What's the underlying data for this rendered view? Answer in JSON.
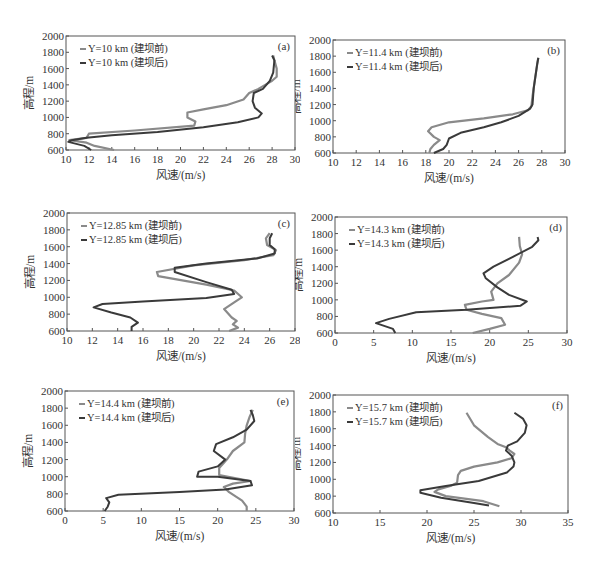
{
  "figure": {
    "ylabel": "高程/m",
    "xlabel": "风速/(m/s)",
    "legend_suffix_before": "(建坝前)",
    "legend_suffix_after": "(建坝后)",
    "colors": {
      "before": "#8a8a8a",
      "after": "#3a3a3a",
      "frame": "#555555"
    }
  },
  "chart_data": [
    {
      "type": "line",
      "panel": "(a)",
      "title": "",
      "xlabel": "风速/(m/s)",
      "ylabel": "高程/m",
      "xlim": [
        10,
        30
      ],
      "ylim": [
        600,
        2000
      ],
      "xticks": [
        10,
        12,
        14,
        16,
        18,
        20,
        22,
        24,
        26,
        28,
        30
      ],
      "yticks": [
        600,
        800,
        1000,
        1200,
        1400,
        1600,
        1800,
        2000
      ],
      "legend_position": "upper left",
      "series": [
        {
          "name": "Y=10 km (建坝前)",
          "points": [
            [
              14.2,
              600
            ],
            [
              12.5,
              650
            ],
            [
              11.8,
              690
            ],
            [
              10.3,
              720
            ],
            [
              11.8,
              750
            ],
            [
              12,
              800
            ],
            [
              16,
              840
            ],
            [
              21.2,
              900
            ],
            [
              21.3,
              950
            ],
            [
              20.6,
              1000
            ],
            [
              20.6,
              1060
            ],
            [
              22,
              1100
            ],
            [
              24,
              1150
            ],
            [
              25.5,
              1220
            ],
            [
              26,
              1300
            ],
            [
              26.8,
              1350
            ],
            [
              27.4,
              1400
            ],
            [
              28,
              1450
            ],
            [
              28.4,
              1500
            ],
            [
              28.4,
              1600
            ],
            [
              28.2,
              1700
            ],
            [
              28.1,
              1760
            ]
          ]
        },
        {
          "name": "Y=10 km (建坝后)",
          "points": [
            [
              12.2,
              600
            ],
            [
              11.6,
              650
            ],
            [
              10.2,
              700
            ],
            [
              10.5,
              720
            ],
            [
              11.8,
              750
            ],
            [
              14,
              780
            ],
            [
              18,
              820
            ],
            [
              22,
              880
            ],
            [
              25,
              940
            ],
            [
              26.8,
              1000
            ],
            [
              27.1,
              1050
            ],
            [
              26.5,
              1120
            ],
            [
              26.3,
              1200
            ],
            [
              26.4,
              1300
            ],
            [
              27.2,
              1350
            ],
            [
              27.8,
              1450
            ],
            [
              28.1,
              1550
            ],
            [
              28.2,
              1700
            ],
            [
              28.0,
              1760
            ]
          ]
        }
      ]
    },
    {
      "type": "line",
      "panel": "(b)",
      "title": "",
      "xlabel": "风速/(m/s)",
      "ylabel": "高程/m",
      "xlim": [
        10,
        30
      ],
      "ylim": [
        600,
        2000
      ],
      "xticks": [
        10,
        12,
        14,
        16,
        18,
        20,
        22,
        24,
        26,
        28,
        30
      ],
      "yticks": [
        600,
        800,
        1000,
        1200,
        1400,
        1600,
        1800,
        2000
      ],
      "legend_position": "upper left",
      "series": [
        {
          "name": "Y=11.4 km (建坝前)",
          "points": [
            [
              18.3,
              600
            ],
            [
              18.4,
              650
            ],
            [
              18.7,
              700
            ],
            [
              19.2,
              760
            ],
            [
              18.7,
              800
            ],
            [
              18.2,
              870
            ],
            [
              18.5,
              920
            ],
            [
              20,
              980
            ],
            [
              23,
              1030
            ],
            [
              25.5,
              1080
            ],
            [
              26.8,
              1130
            ],
            [
              27.1,
              1180
            ],
            [
              27.2,
              1300
            ],
            [
              27.4,
              1500
            ],
            [
              27.6,
              1700
            ],
            [
              27.7,
              1780
            ]
          ]
        },
        {
          "name": "Y=11.4 km (建坝后)",
          "points": [
            [
              18.7,
              600
            ],
            [
              19.5,
              650
            ],
            [
              19.8,
              700
            ],
            [
              20,
              780
            ],
            [
              21,
              850
            ],
            [
              23,
              920
            ],
            [
              24.5,
              980
            ],
            [
              26,
              1060
            ],
            [
              27,
              1150
            ],
            [
              27.2,
              1200
            ],
            [
              27.3,
              1400
            ],
            [
              27.6,
              1700
            ],
            [
              27.7,
              1780
            ]
          ]
        }
      ]
    },
    {
      "type": "line",
      "panel": "(c)",
      "title": "",
      "xlabel": "风速/(m/s)",
      "ylabel": "高程/m",
      "xlim": [
        10,
        28
      ],
      "ylim": [
        600,
        2000
      ],
      "xticks": [
        10,
        12,
        14,
        16,
        18,
        20,
        22,
        24,
        26,
        28
      ],
      "yticks": [
        600,
        800,
        1000,
        1200,
        1400,
        1600,
        1800,
        2000
      ],
      "legend_position": "upper left",
      "series": [
        {
          "name": "Y=12.85 km (建坝前)",
          "points": [
            [
              22.8,
              600
            ],
            [
              23.5,
              640
            ],
            [
              23.1,
              680
            ],
            [
              23.4,
              720
            ],
            [
              23.0,
              760
            ],
            [
              22.4,
              860
            ],
            [
              23.2,
              940
            ],
            [
              23.8,
              1000
            ],
            [
              23.2,
              1080
            ],
            [
              21,
              1150
            ],
            [
              17.2,
              1250
            ],
            [
              17.1,
              1300
            ],
            [
              20,
              1380
            ],
            [
              24,
              1440
            ],
            [
              26.3,
              1500
            ],
            [
              26.5,
              1560
            ],
            [
              25.8,
              1620
            ],
            [
              25.7,
              1700
            ],
            [
              26,
              1760
            ]
          ]
        },
        {
          "name": "Y=12.85 km (建坝后)",
          "points": [
            [
              15.1,
              600
            ],
            [
              15.1,
              650
            ],
            [
              15.6,
              700
            ],
            [
              15,
              760
            ],
            [
              13.5,
              820
            ],
            [
              12.1,
              880
            ],
            [
              12.8,
              920
            ],
            [
              16,
              950
            ],
            [
              21,
              990
            ],
            [
              23.2,
              1040
            ],
            [
              23,
              1090
            ],
            [
              21,
              1180
            ],
            [
              18.5,
              1300
            ],
            [
              18.5,
              1350
            ],
            [
              21,
              1400
            ],
            [
              25,
              1460
            ],
            [
              26.4,
              1520
            ],
            [
              26.4,
              1570
            ],
            [
              26,
              1620
            ],
            [
              26,
              1700
            ],
            [
              26.2,
              1760
            ]
          ]
        }
      ]
    },
    {
      "type": "line",
      "panel": "(d)",
      "title": "",
      "xlabel": "风速/(m/s)",
      "ylabel": "高程/m",
      "xlim": [
        0,
        30
      ],
      "ylim": [
        600,
        2000
      ],
      "xticks": [
        0,
        5,
        10,
        15,
        20,
        25,
        30
      ],
      "yticks": [
        600,
        800,
        1000,
        1200,
        1400,
        1600,
        1800,
        2000
      ],
      "legend_position": "upper left",
      "series": [
        {
          "name": "Y=14.3 km (建坝前)",
          "points": [
            [
              17.8,
              600
            ],
            [
              20,
              650
            ],
            [
              22,
              700
            ],
            [
              21.5,
              780
            ],
            [
              19,
              830
            ],
            [
              17,
              880
            ],
            [
              16.8,
              940
            ],
            [
              19,
              980
            ],
            [
              20.5,
              1000
            ],
            [
              20.2,
              1100
            ],
            [
              21,
              1200
            ],
            [
              22.5,
              1300
            ],
            [
              23.8,
              1450
            ],
            [
              24.2,
              1550
            ],
            [
              23.9,
              1650
            ],
            [
              23.8,
              1760
            ]
          ]
        },
        {
          "name": "Y=14.3 km (建坝后)",
          "points": [
            [
              7.8,
              600
            ],
            [
              7.5,
              650
            ],
            [
              5.3,
              720
            ],
            [
              7,
              770
            ],
            [
              10.5,
              850
            ],
            [
              17,
              880
            ],
            [
              24,
              930
            ],
            [
              24.8,
              980
            ],
            [
              22.5,
              1060
            ],
            [
              21,
              1150
            ],
            [
              19.5,
              1260
            ],
            [
              19.2,
              1320
            ],
            [
              20.5,
              1400
            ],
            [
              23,
              1520
            ],
            [
              25.5,
              1640
            ],
            [
              26.3,
              1720
            ],
            [
              26.2,
              1760
            ]
          ]
        }
      ]
    },
    {
      "type": "line",
      "panel": "(e)",
      "title": "",
      "xlabel": "风速/(m/s)",
      "ylabel": "高程/m",
      "xlim": [
        0,
        30
      ],
      "ylim": [
        600,
        2000
      ],
      "xticks": [
        0,
        5,
        10,
        15,
        20,
        25,
        30
      ],
      "yticks": [
        600,
        800,
        1000,
        1200,
        1400,
        1600,
        1800,
        2000
      ],
      "legend_position": "upper left",
      "series": [
        {
          "name": "Y=14.4 km (建坝前)",
          "points": [
            [
              23.8,
              600
            ],
            [
              23.8,
              650
            ],
            [
              23.2,
              720
            ],
            [
              21.5,
              820
            ],
            [
              20.8,
              880
            ],
            [
              22,
              920
            ],
            [
              24.3,
              950
            ],
            [
              20.2,
              1020
            ],
            [
              20.2,
              1100
            ],
            [
              21.2,
              1200
            ],
            [
              22,
              1300
            ],
            [
              23.5,
              1400
            ],
            [
              23.6,
              1500
            ],
            [
              23.8,
              1600
            ],
            [
              24.2,
              1700
            ],
            [
              24.6,
              1780
            ]
          ]
        },
        {
          "name": "Y=14.4 km (建坝后)",
          "points": [
            [
              5.2,
              600
            ],
            [
              5.6,
              650
            ],
            [
              5.8,
              700
            ],
            [
              5.4,
              750
            ],
            [
              7,
              790
            ],
            [
              15,
              820
            ],
            [
              21,
              850
            ],
            [
              24.5,
              900
            ],
            [
              24.3,
              950
            ],
            [
              20,
              1000
            ],
            [
              17.3,
              1000
            ],
            [
              17.5,
              1060
            ],
            [
              20,
              1120
            ],
            [
              21,
              1200
            ],
            [
              19.5,
              1300
            ],
            [
              19.8,
              1380
            ],
            [
              22,
              1460
            ],
            [
              23.8,
              1550
            ],
            [
              24.8,
              1650
            ],
            [
              24.6,
              1720
            ],
            [
              24.3,
              1780
            ]
          ]
        }
      ]
    },
    {
      "type": "line",
      "panel": "(f)",
      "title": "",
      "xlabel": "风速/(m/s)",
      "ylabel": "高程/m",
      "xlim": [
        10,
        35
      ],
      "ylim": [
        600,
        2000
      ],
      "xticks": [
        10,
        15,
        20,
        25,
        30,
        35
      ],
      "yticks": [
        600,
        800,
        1000,
        1200,
        1400,
        1600,
        1800,
        2000
      ],
      "legend_position": "upper left",
      "series": [
        {
          "name": "Y=15.7 km (建坝前)",
          "points": [
            [
              27.7,
              680
            ],
            [
              26,
              740
            ],
            [
              22,
              800
            ],
            [
              20.8,
              850
            ],
            [
              21.2,
              880
            ],
            [
              22.5,
              920
            ],
            [
              23.2,
              960
            ],
            [
              23.3,
              1050
            ],
            [
              23.6,
              1100
            ],
            [
              25,
              1150
            ],
            [
              27.5,
              1200
            ],
            [
              29,
              1250
            ],
            [
              29.3,
              1300
            ],
            [
              28.8,
              1340
            ],
            [
              28.4,
              1380
            ],
            [
              27.5,
              1420
            ],
            [
              26.5,
              1500
            ],
            [
              25,
              1640
            ],
            [
              24.2,
              1790
            ]
          ]
        },
        {
          "name": "Y=15.7 km (建坝后)",
          "points": [
            [
              26.6,
              690
            ],
            [
              25,
              720
            ],
            [
              21.5,
              780
            ],
            [
              19.3,
              840
            ],
            [
              19.3,
              870
            ],
            [
              22,
              920
            ],
            [
              25.5,
              980
            ],
            [
              28.5,
              1080
            ],
            [
              29.2,
              1150
            ],
            [
              29.3,
              1200
            ],
            [
              29.0,
              1280
            ],
            [
              28.4,
              1340
            ],
            [
              28.6,
              1400
            ],
            [
              29.6,
              1450
            ],
            [
              30.4,
              1550
            ],
            [
              30.6,
              1640
            ],
            [
              30.2,
              1720
            ],
            [
              29.3,
              1790
            ]
          ]
        }
      ]
    }
  ]
}
